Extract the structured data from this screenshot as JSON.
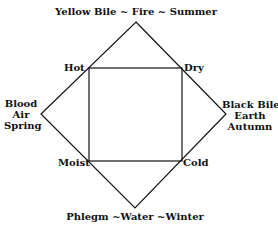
{
  "diagram": {
    "title_top": "Yellow Bile ~ Fire ~ Summer",
    "bottom": "Phlegm ~Water ~Winter",
    "left": [
      "Blood",
      "Air",
      "Spring"
    ],
    "right": [
      "Black Bile",
      "Earth",
      "Autumn"
    ],
    "corners": {
      "top_left": "Hot",
      "top_right": "Dry",
      "bottom_left": "Moist",
      "bottom_right": "Cold"
    },
    "line_color": "#111111"
  }
}
